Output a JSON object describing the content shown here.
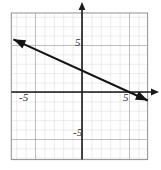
{
  "chart_data": {
    "type": "line",
    "title": "",
    "xlabel": "",
    "ylabel": "",
    "xlim": [
      -7.5,
      7
    ],
    "ylim": [
      -7.2,
      8.4
    ],
    "grid": true,
    "grid_step": 1,
    "legend": "none",
    "axis_tick_labels": {
      "x": [
        "-5",
        "5"
      ],
      "y": [
        "5",
        "-5"
      ]
    },
    "x_tick_values": [
      -5,
      5
    ],
    "y_tick_values": [
      5,
      -5
    ],
    "series": [
      {
        "name": "line",
        "kind": "straight-line",
        "slope": -0.46,
        "intercept": 2.3,
        "arrows": "both",
        "x_intercept": 5.0,
        "y_intercept": 2.3,
        "endpoints": [
          {
            "x": -7.3,
            "y": 5.6
          },
          {
            "x": 7.0,
            "y": -0.9
          }
        ],
        "points": [
          {
            "x": -7.3,
            "y": 5.6
          },
          {
            "x": -5,
            "y": 4.6
          },
          {
            "x": 0,
            "y": 2.3
          },
          {
            "x": 5,
            "y": 0.0
          },
          {
            "x": 7.0,
            "y": -0.9
          }
        ],
        "color": "#141414"
      }
    ],
    "colors": {
      "grid_minor": "#c9c9c9",
      "grid_major": "#8f8f8f",
      "axis": "#1a1a1a",
      "line": "#141414",
      "background": "#ffffff",
      "label": "#2b2b2b"
    }
  },
  "labels": {
    "x_negative_five": "-5",
    "x_positive_five": "5",
    "y_positive_five": "5",
    "y_negative_five": "-5"
  }
}
